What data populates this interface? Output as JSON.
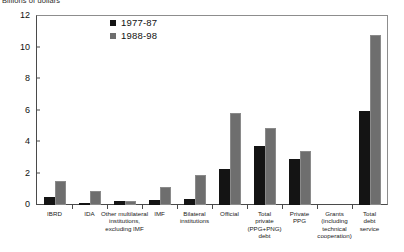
{
  "chart_data": {
    "type": "bar",
    "title": "",
    "ylabel": "Billions of dollars",
    "xlabel": "",
    "ylim": [
      0,
      12
    ],
    "yticks": [
      0,
      2,
      4,
      6,
      8,
      10,
      12
    ],
    "ytick_labels": [
      "0",
      "2",
      "4",
      "6",
      "8",
      "10",
      "12"
    ],
    "grid": false,
    "legend_position": "top-center",
    "categories": [
      "IBRD",
      "IDA",
      "Other multilateral institutions, excluding IMF",
      "IMF",
      "Bilateral institutions",
      "Official",
      "Total private (PPG+PNG) debt",
      "Private PPG",
      "Grants (including technical cooperation)",
      "Total debt service"
    ],
    "category_lines": [
      [
        "IBRD"
      ],
      [
        "IDA"
      ],
      [
        "Other multilateral",
        "institutions,",
        "excluding IMF"
      ],
      [
        "IMF"
      ],
      [
        "Bilateral",
        "institutions"
      ],
      [
        "Official"
      ],
      [
        "Total",
        "private",
        "(PPG+PNG)",
        "debt"
      ],
      [
        "Private",
        "PPG"
      ],
      [
        "Grants",
        "(including",
        "technical",
        "cooperation)"
      ],
      [
        "Total",
        "debt",
        "service"
      ]
    ],
    "series": [
      {
        "name": "1977-87",
        "color": "#141414",
        "values": [
          0.5,
          0.1,
          0.25,
          0.35,
          0.4,
          2.3,
          3.75,
          2.95,
          0.0,
          6.0
        ]
      },
      {
        "name": "1988-98",
        "color": "#6e6e6e",
        "values": [
          1.5,
          0.9,
          0.25,
          1.15,
          1.9,
          5.85,
          4.9,
          3.4,
          0.0,
          10.8
        ]
      }
    ]
  },
  "legend": {
    "items": [
      {
        "label": "1977-87",
        "color": "#141414"
      },
      {
        "label": "1988-98",
        "color": "#6e6e6e"
      }
    ]
  }
}
